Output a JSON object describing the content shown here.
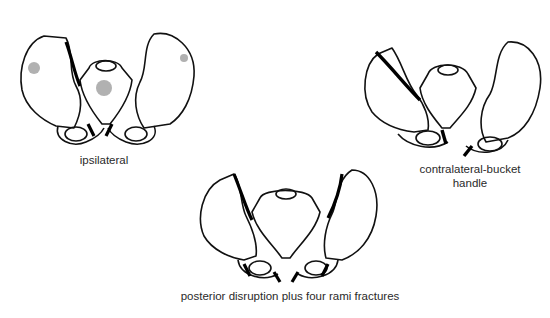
{
  "diagram": {
    "panels": [
      {
        "id": "ipsilateral",
        "label": "ipsilateral"
      },
      {
        "id": "contralateral",
        "label_line1": "contralateral-bucket",
        "label_line2": "handle"
      },
      {
        "id": "posterior",
        "label": "posterior disruption plus four rami fractures"
      }
    ],
    "colors": {
      "ink": "#111111",
      "background": "#ffffff",
      "label": "#2a2a2a"
    }
  }
}
